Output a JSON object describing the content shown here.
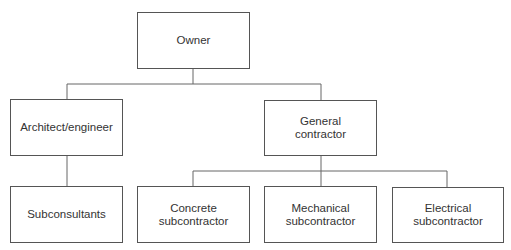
{
  "diagram": {
    "type": "org-chart",
    "nodes": {
      "owner": {
        "lines": [
          "Owner"
        ]
      },
      "architect": {
        "lines": [
          "Architect/engineer"
        ]
      },
      "general_contractor": {
        "lines": [
          "General",
          "contractor"
        ]
      },
      "subconsultants": {
        "lines": [
          "Subconsultants"
        ]
      },
      "concrete": {
        "lines": [
          "Concrete",
          "subcontractor"
        ]
      },
      "mechanical": {
        "lines": [
          "Mechanical",
          "subcontractor"
        ]
      },
      "electrical": {
        "lines": [
          "Electrical",
          "subcontractor"
        ]
      }
    },
    "edges": [
      [
        "Owner",
        "Architect/engineer"
      ],
      [
        "Owner",
        "General contractor"
      ],
      [
        "Architect/engineer",
        "Subconsultants"
      ],
      [
        "General contractor",
        "Concrete subcontractor"
      ],
      [
        "General contractor",
        "Mechanical subcontractor"
      ],
      [
        "General contractor",
        "Electrical subcontractor"
      ]
    ],
    "colors": {
      "border": "#555555",
      "line": "#666666",
      "text": "#333333",
      "background": "#ffffff"
    }
  }
}
